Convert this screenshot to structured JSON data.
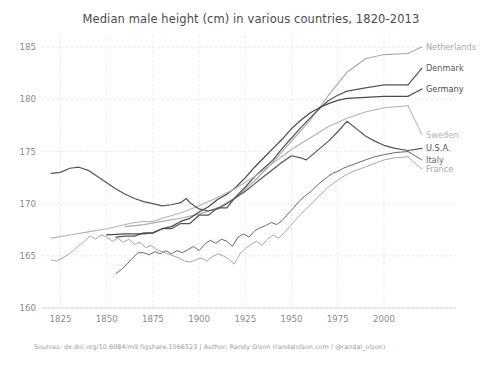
{
  "figure": {
    "title": "Median male height (cm) in various countries, 1820-2013",
    "clipped_header_text": "",
    "source_note": "Sources: dx.doi.org/10.6084/m9.figshare.1066523 | Author: Randy Olson (randalolson.com / @randal_olson)",
    "background_color": "#ffffff"
  },
  "chart_data": {
    "type": "line",
    "title": "Median male height (cm) in various countries, 1820-2013",
    "xlabel": "",
    "ylabel": "",
    "xlim": [
      1815,
      2013
    ],
    "ylim": [
      160,
      185.6
    ],
    "xticks": [
      1825,
      1850,
      1875,
      1900,
      1925,
      1950,
      1975,
      2000
    ],
    "yticks": [
      160,
      165,
      170,
      175,
      180,
      185
    ],
    "grid": true,
    "legend_position": "right-inline",
    "series": [
      {
        "name": "Netherlands",
        "color": "#aaaaaa",
        "width": 1.15,
        "label_y": 185.05,
        "points": [
          [
            1860,
            167.8
          ],
          [
            1870,
            168.0
          ],
          [
            1880,
            168.3
          ],
          [
            1890,
            168.6
          ],
          [
            1900,
            169.0
          ],
          [
            1910,
            169.6
          ],
          [
            1920,
            170.6
          ],
          [
            1930,
            172.2
          ],
          [
            1940,
            174.0
          ],
          [
            1950,
            176.0
          ],
          [
            1960,
            178.0
          ],
          [
            1970,
            180.4
          ],
          [
            1980,
            182.6
          ],
          [
            1990,
            183.9
          ],
          [
            2000,
            184.3
          ],
          [
            2013,
            184.4
          ]
        ]
      },
      {
        "name": "Denmark",
        "color": "#555555",
        "width": 1.25,
        "label_y": 183.0,
        "points": [
          [
            1855,
            166.8
          ],
          [
            1860,
            166.9
          ],
          [
            1865,
            166.9
          ],
          [
            1870,
            167.2
          ],
          [
            1875,
            167.2
          ],
          [
            1880,
            167.6
          ],
          [
            1885,
            167.6
          ],
          [
            1890,
            168.1
          ],
          [
            1895,
            168.1
          ],
          [
            1900,
            168.9
          ],
          [
            1905,
            168.9
          ],
          [
            1910,
            169.6
          ],
          [
            1915,
            169.6
          ],
          [
            1920,
            170.7
          ],
          [
            1925,
            171.6
          ],
          [
            1930,
            172.6
          ],
          [
            1935,
            173.4
          ],
          [
            1940,
            174.2
          ],
          [
            1945,
            175.3
          ],
          [
            1950,
            176.3
          ],
          [
            1955,
            177.3
          ],
          [
            1960,
            178.2
          ],
          [
            1965,
            179.1
          ],
          [
            1970,
            179.9
          ],
          [
            1975,
            180.4
          ],
          [
            1980,
            180.8
          ],
          [
            1990,
            181.1
          ],
          [
            2000,
            181.4
          ],
          [
            2013,
            181.4
          ]
        ]
      },
      {
        "name": "Germany",
        "color": "#4a4a4a",
        "width": 1.25,
        "label_y": 181.0,
        "points": [
          [
            1850,
            167.0
          ],
          [
            1860,
            167.1
          ],
          [
            1870,
            167.1
          ],
          [
            1875,
            167.2
          ],
          [
            1880,
            167.6
          ],
          [
            1885,
            167.8
          ],
          [
            1890,
            168.3
          ],
          [
            1895,
            168.6
          ],
          [
            1900,
            169.2
          ],
          [
            1905,
            169.7
          ],
          [
            1910,
            170.4
          ],
          [
            1915,
            170.9
          ],
          [
            1920,
            171.6
          ],
          [
            1925,
            172.5
          ],
          [
            1930,
            173.5
          ],
          [
            1935,
            174.4
          ],
          [
            1940,
            175.3
          ],
          [
            1945,
            176.2
          ],
          [
            1950,
            177.2
          ],
          [
            1955,
            178.0
          ],
          [
            1960,
            178.7
          ],
          [
            1965,
            179.2
          ],
          [
            1970,
            179.6
          ],
          [
            1975,
            179.9
          ],
          [
            1980,
            180.1
          ],
          [
            1990,
            180.2
          ],
          [
            2000,
            180.3
          ],
          [
            2013,
            180.3
          ]
        ]
      },
      {
        "name": "Sweden",
        "color": "#b2b2b2",
        "width": 1.05,
        "label_y": 176.6,
        "points": [
          [
            1820,
            166.7
          ],
          [
            1830,
            167.0
          ],
          [
            1840,
            167.3
          ],
          [
            1850,
            167.6
          ],
          [
            1860,
            168.0
          ],
          [
            1865,
            168.2
          ],
          [
            1870,
            168.3
          ],
          [
            1875,
            168.3
          ],
          [
            1880,
            168.6
          ],
          [
            1890,
            169.1
          ],
          [
            1900,
            169.8
          ],
          [
            1910,
            170.6
          ],
          [
            1920,
            171.5
          ],
          [
            1930,
            172.6
          ],
          [
            1940,
            173.9
          ],
          [
            1950,
            175.2
          ],
          [
            1960,
            176.3
          ],
          [
            1970,
            177.4
          ],
          [
            1980,
            178.2
          ],
          [
            1990,
            178.8
          ],
          [
            2000,
            179.2
          ],
          [
            2013,
            179.4
          ]
        ]
      },
      {
        "name": "U.S.A.",
        "color": "#555555",
        "width": 1.2,
        "label_y": 175.3,
        "points": [
          [
            1820,
            172.9
          ],
          [
            1825,
            173.0
          ],
          [
            1830,
            173.4
          ],
          [
            1835,
            173.5
          ],
          [
            1840,
            173.2
          ],
          [
            1845,
            172.6
          ],
          [
            1850,
            172.0
          ],
          [
            1855,
            171.4
          ],
          [
            1860,
            170.9
          ],
          [
            1865,
            170.5
          ],
          [
            1870,
            170.2
          ],
          [
            1875,
            170.0
          ],
          [
            1880,
            169.8
          ],
          [
            1885,
            169.9
          ],
          [
            1890,
            170.1
          ],
          [
            1893,
            170.5
          ],
          [
            1895,
            170.1
          ],
          [
            1900,
            169.5
          ],
          [
            1905,
            169.3
          ],
          [
            1910,
            169.5
          ],
          [
            1915,
            170.0
          ],
          [
            1920,
            170.6
          ],
          [
            1925,
            171.2
          ],
          [
            1930,
            171.9
          ],
          [
            1935,
            172.6
          ],
          [
            1940,
            173.3
          ],
          [
            1945,
            174.0
          ],
          [
            1950,
            174.6
          ],
          [
            1955,
            174.4
          ],
          [
            1958,
            174.2
          ],
          [
            1962,
            174.8
          ],
          [
            1966,
            175.4
          ],
          [
            1970,
            176.0
          ],
          [
            1975,
            176.9
          ],
          [
            1980,
            177.9
          ],
          [
            1985,
            177.2
          ],
          [
            1990,
            176.5
          ],
          [
            1995,
            176.0
          ],
          [
            2000,
            175.6
          ],
          [
            2006,
            175.3
          ],
          [
            2013,
            175.1
          ]
        ]
      },
      {
        "name": "Italy",
        "color": "#6a6a6a",
        "width": 1.0,
        "label_y": 174.2,
        "points": [
          [
            1855,
            163.3
          ],
          [
            1858,
            163.7
          ],
          [
            1861,
            164.2
          ],
          [
            1864,
            164.8
          ],
          [
            1867,
            165.3
          ],
          [
            1870,
            165.3
          ],
          [
            1873,
            165.1
          ],
          [
            1876,
            165.4
          ],
          [
            1879,
            165.2
          ],
          [
            1882,
            165.5
          ],
          [
            1885,
            165.2
          ],
          [
            1888,
            165.5
          ],
          [
            1891,
            165.3
          ],
          [
            1894,
            165.6
          ],
          [
            1897,
            165.9
          ],
          [
            1900,
            165.5
          ],
          [
            1903,
            166.1
          ],
          [
            1906,
            166.5
          ],
          [
            1909,
            166.2
          ],
          [
            1912,
            166.6
          ],
          [
            1915,
            166.4
          ],
          [
            1918,
            165.9
          ],
          [
            1921,
            166.8
          ],
          [
            1924,
            167.1
          ],
          [
            1927,
            166.8
          ],
          [
            1930,
            167.4
          ],
          [
            1933,
            167.7
          ],
          [
            1936,
            167.9
          ],
          [
            1939,
            168.2
          ],
          [
            1942,
            168.0
          ],
          [
            1945,
            168.4
          ],
          [
            1948,
            169.0
          ],
          [
            1951,
            169.6
          ],
          [
            1954,
            170.2
          ],
          [
            1957,
            170.7
          ],
          [
            1960,
            171.1
          ],
          [
            1963,
            171.6
          ],
          [
            1966,
            172.1
          ],
          [
            1969,
            172.5
          ],
          [
            1972,
            172.9
          ],
          [
            1975,
            173.1
          ],
          [
            1978,
            173.4
          ],
          [
            1981,
            173.6
          ],
          [
            1984,
            173.8
          ],
          [
            1987,
            174.0
          ],
          [
            1990,
            174.2
          ],
          [
            1995,
            174.5
          ],
          [
            2000,
            174.7
          ],
          [
            2006,
            174.9
          ],
          [
            2013,
            175.0
          ]
        ]
      },
      {
        "name": "France",
        "color": "#a8a8a8",
        "width": 1.0,
        "label_y": 173.3,
        "points": [
          [
            1820,
            164.6
          ],
          [
            1823,
            164.5
          ],
          [
            1826,
            164.8
          ],
          [
            1829,
            165.1
          ],
          [
            1832,
            165.5
          ],
          [
            1835,
            166.0
          ],
          [
            1838,
            166.4
          ],
          [
            1841,
            166.9
          ],
          [
            1844,
            166.6
          ],
          [
            1847,
            167.0
          ],
          [
            1850,
            166.8
          ],
          [
            1853,
            166.4
          ],
          [
            1856,
            166.7
          ],
          [
            1859,
            166.3
          ],
          [
            1862,
            166.6
          ],
          [
            1865,
            166.1
          ],
          [
            1868,
            166.3
          ],
          [
            1871,
            165.8
          ],
          [
            1874,
            166.0
          ],
          [
            1877,
            165.6
          ],
          [
            1880,
            165.4
          ],
          [
            1883,
            165.2
          ],
          [
            1886,
            165.0
          ],
          [
            1889,
            164.8
          ],
          [
            1892,
            164.5
          ],
          [
            1895,
            164.4
          ],
          [
            1898,
            164.6
          ],
          [
            1901,
            164.8
          ],
          [
            1904,
            164.5
          ],
          [
            1907,
            164.9
          ],
          [
            1910,
            165.2
          ],
          [
            1913,
            165.0
          ],
          [
            1916,
            164.7
          ],
          [
            1919,
            164.2
          ],
          [
            1922,
            165.2
          ],
          [
            1925,
            165.7
          ],
          [
            1928,
            166.1
          ],
          [
            1931,
            166.4
          ],
          [
            1934,
            166.0
          ],
          [
            1937,
            166.6
          ],
          [
            1940,
            167.0
          ],
          [
            1943,
            166.7
          ],
          [
            1946,
            167.2
          ],
          [
            1949,
            167.8
          ],
          [
            1952,
            168.4
          ],
          [
            1955,
            169.0
          ],
          [
            1958,
            169.5
          ],
          [
            1961,
            170.0
          ],
          [
            1964,
            170.6
          ],
          [
            1967,
            171.1
          ],
          [
            1970,
            171.6
          ],
          [
            1973,
            172.0
          ],
          [
            1976,
            172.4
          ],
          [
            1979,
            172.7
          ],
          [
            1982,
            173.0
          ],
          [
            1985,
            173.2
          ],
          [
            1988,
            173.4
          ],
          [
            1991,
            173.6
          ],
          [
            1994,
            173.8
          ],
          [
            1997,
            174.0
          ],
          [
            2000,
            174.2
          ],
          [
            2006,
            174.4
          ],
          [
            2013,
            174.5
          ]
        ]
      }
    ]
  }
}
